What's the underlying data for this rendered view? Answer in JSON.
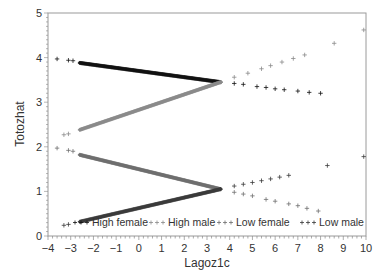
{
  "chart_data": {
    "type": "scatter",
    "title": "",
    "xlabel": "Lagoz1c",
    "ylabel": "Totozhat",
    "xlim": [
      -4,
      10
    ],
    "ylim": [
      0,
      5
    ],
    "xticks": [
      -4,
      -3,
      -2,
      -1,
      0,
      1,
      2,
      3,
      4,
      5,
      6,
      7,
      8,
      9,
      10
    ],
    "yticks": [
      0,
      1,
      2,
      3,
      4,
      5
    ],
    "grid": false,
    "legend_position": "bottom-inside",
    "marker": "+",
    "series": [
      {
        "name": "High female",
        "color": "#111111",
        "line": {
          "x0": -2.6,
          "y0": 3.88,
          "x1": 3.6,
          "y1": 3.45
        },
        "points": [
          [
            -3.6,
            3.97
          ],
          [
            -3.1,
            3.94
          ],
          [
            -2.9,
            3.93
          ],
          [
            4.2,
            3.42
          ],
          [
            4.6,
            3.4
          ],
          [
            5.2,
            3.35
          ],
          [
            5.6,
            3.33
          ],
          [
            6.0,
            3.3
          ],
          [
            6.4,
            3.28
          ],
          [
            7.0,
            3.25
          ],
          [
            7.5,
            3.22
          ],
          [
            8.0,
            3.2
          ]
        ]
      },
      {
        "name": "High male",
        "color": "#8a8a8a",
        "line": {
          "x0": -2.6,
          "y0": 2.38,
          "x1": 3.6,
          "y1": 3.45
        },
        "points": [
          [
            -3.3,
            2.27
          ],
          [
            -3.1,
            2.29
          ],
          [
            4.2,
            3.56
          ],
          [
            4.8,
            3.65
          ],
          [
            5.4,
            3.75
          ],
          [
            5.8,
            3.82
          ],
          [
            6.3,
            3.9
          ],
          [
            6.8,
            3.98
          ],
          [
            7.3,
            4.06
          ],
          [
            8.6,
            4.32
          ],
          [
            9.9,
            4.62
          ]
        ]
      },
      {
        "name": "Low female",
        "color": "#6e6e6e",
        "line": {
          "x0": -2.6,
          "y0": 1.82,
          "x1": 3.6,
          "y1": 1.05
        },
        "points": [
          [
            -3.6,
            1.97
          ],
          [
            -3.1,
            1.92
          ],
          [
            -2.9,
            1.9
          ],
          [
            4.2,
            0.98
          ],
          [
            4.6,
            0.94
          ],
          [
            5.0,
            0.9
          ],
          [
            5.6,
            0.82
          ],
          [
            6.0,
            0.78
          ],
          [
            6.6,
            0.72
          ],
          [
            7.0,
            0.68
          ],
          [
            7.4,
            0.62
          ],
          [
            7.9,
            0.56
          ]
        ]
      },
      {
        "name": "Low male",
        "color": "#3a3a3a",
        "line": {
          "x0": -2.6,
          "y0": 0.32,
          "x1": 3.6,
          "y1": 1.05
        },
        "points": [
          [
            -3.3,
            0.24
          ],
          [
            -3.1,
            0.26
          ],
          [
            4.2,
            1.12
          ],
          [
            4.6,
            1.16
          ],
          [
            5.0,
            1.2
          ],
          [
            5.4,
            1.24
          ],
          [
            5.8,
            1.28
          ],
          [
            6.2,
            1.32
          ],
          [
            6.6,
            1.36
          ],
          [
            8.3,
            1.58
          ],
          [
            9.9,
            1.78
          ]
        ]
      }
    ]
  },
  "axes": {
    "x_title": "Lagoz1c",
    "y_title": "Totozhat"
  },
  "legend": {
    "items": [
      "High female",
      "High male",
      "Low female",
      "Low male"
    ]
  }
}
